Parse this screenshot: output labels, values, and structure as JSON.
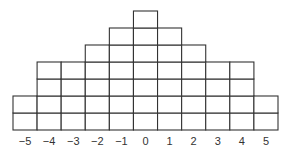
{
  "chart_data": {
    "type": "bar",
    "style": "stacked unit squares (dot-plot grid)",
    "title": "",
    "xlabel": "",
    "ylabel": "",
    "categories": [
      "−5",
      "−4",
      "−3",
      "−2",
      "−1",
      "0",
      "1",
      "2",
      "3",
      "4",
      "5"
    ],
    "x": [
      -5,
      -4,
      -3,
      -2,
      -1,
      0,
      1,
      2,
      3,
      4,
      5
    ],
    "values": [
      2,
      4,
      4,
      5,
      6,
      7,
      6,
      5,
      4,
      4,
      2
    ],
    "ylim": [
      0,
      7
    ],
    "grid": false,
    "legend": "none",
    "colors": {
      "cell_fill": "#ffffff",
      "cell_stroke": "#333333",
      "text": "#333333"
    }
  }
}
